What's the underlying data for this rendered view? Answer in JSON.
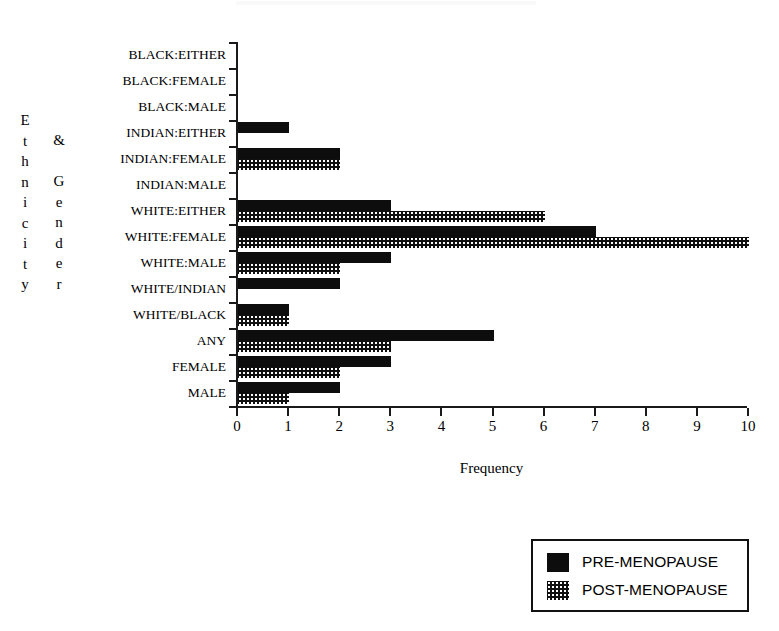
{
  "chart_data": {
    "type": "bar",
    "orientation": "horizontal",
    "title": "",
    "xlabel": "Frequency",
    "ylabel": "Ethnicity & Gender",
    "ylabel_column_1": "Ethnicity",
    "ylabel_column_2": "& Gender",
    "xlim": [
      0,
      10
    ],
    "xticks": [
      0,
      1,
      2,
      3,
      4,
      5,
      6,
      7,
      8,
      9,
      10
    ],
    "xtick_labels": [
      "0",
      "1",
      "2",
      "3",
      "4",
      "5",
      "6",
      "7",
      "8",
      "9",
      "10"
    ],
    "grid": false,
    "legend_position": "bottom-right",
    "categories": [
      "BLACK:EITHER",
      "BLACK:FEMALE",
      "BLACK:MALE",
      "INDIAN:EITHER",
      "INDIAN:FEMALE",
      "INDIAN:MALE",
      "WHITE:EITHER",
      "WHITE:FEMALE",
      "WHITE:MALE",
      "WHITE/INDIAN",
      "WHITE/BLACK",
      "ANY",
      "FEMALE",
      "MALE"
    ],
    "series": [
      {
        "name": "PRE-MENOPAUSE",
        "fill": "solid-black",
        "color": "#0d0d0d",
        "values": [
          0,
          0,
          0,
          1,
          2,
          0,
          3,
          7,
          3,
          2,
          1,
          5,
          3,
          2
        ]
      },
      {
        "name": "POST-MENOPAUSE",
        "fill": "dotted-stipple",
        "color": "#101010",
        "values": [
          0,
          0,
          0,
          0,
          2,
          0,
          6,
          10,
          2,
          0,
          1,
          3,
          2,
          1
        ]
      }
    ]
  },
  "legend": {
    "items": [
      {
        "label": "PRE-MENOPAUSE",
        "swatch": "solid-black-swatch"
      },
      {
        "label": "POST-MENOPAUSE",
        "swatch": "dotted-stipple-swatch"
      }
    ]
  }
}
